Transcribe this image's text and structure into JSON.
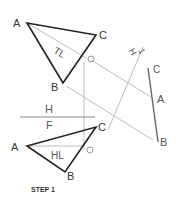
{
  "diagram": {
    "caption": "STEP 1",
    "views": {
      "top": {
        "points": {
          "A": "A",
          "B": "B",
          "C": "C",
          "O": "O"
        },
        "line_label": "TL"
      },
      "front": {
        "points": {
          "A": "A",
          "B": "B",
          "C": "C",
          "O": "O"
        },
        "line_label": "HL"
      },
      "auxiliary": {
        "points": {
          "A": "A",
          "B": "B",
          "C": "C"
        }
      }
    },
    "fold_lines": {
      "hf_top": "H",
      "hf_bottom": "F",
      "h1_left": "H",
      "h1_right": "1"
    },
    "colors": {
      "object_line": "#222222",
      "construction_line": "#bbbbbb",
      "edge_view": "#666666",
      "label": "#555555"
    }
  }
}
